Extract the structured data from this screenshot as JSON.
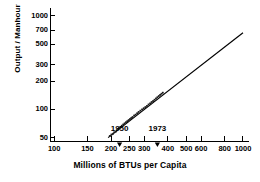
{
  "chart_data": {
    "type": "scatter",
    "title": "",
    "xlabel": "Millions of BTUs per Capita",
    "ylabel": "Output / Manhour",
    "xscale": "log",
    "yscale": "log",
    "xlim": [
      95,
      1050
    ],
    "ylim": [
      46,
      1100
    ],
    "grid": false,
    "legend": null,
    "xticks": [
      100,
      150,
      200,
      250,
      300,
      400,
      500,
      600,
      800,
      1000
    ],
    "xticklabels": [
      "100",
      "150",
      "200",
      "250",
      "300",
      "400",
      "500",
      "600",
      "800",
      "1000"
    ],
    "yticks": [
      50,
      100,
      200,
      300,
      500,
      700,
      1000
    ],
    "yticklabels": [
      "50",
      "100",
      "200",
      "300",
      "500",
      "700",
      "1000"
    ],
    "series": [
      {
        "name": "observations",
        "type": "scatter",
        "marker": "dot",
        "x": [
          197,
          201,
          205,
          208,
          212,
          215,
          218,
          221,
          224,
          228,
          232,
          236,
          240,
          244,
          248,
          252,
          256,
          260,
          265,
          270,
          275,
          280,
          286,
          292,
          298,
          304,
          310,
          316,
          322,
          328,
          334,
          340,
          346,
          352,
          358,
          364,
          370,
          376
        ],
        "y": [
          52,
          54,
          55,
          57,
          58,
          60,
          62,
          63,
          65,
          67,
          69,
          71,
          73,
          75,
          77,
          79,
          81,
          83,
          86,
          88,
          91,
          94,
          97,
          100,
          103,
          106,
          109,
          113,
          116,
          120,
          123,
          127,
          131,
          135,
          139,
          143,
          147,
          151
        ]
      },
      {
        "name": "fit-line",
        "type": "line",
        "x": [
          193,
          1000
        ],
        "y": [
          50,
          660
        ]
      }
    ],
    "annotations": [
      {
        "label": "1950",
        "x": 222,
        "marker": "down-arrow"
      },
      {
        "label": "1973",
        "x": 352,
        "marker": "down-arrow"
      }
    ]
  },
  "colors": {
    "ink": "#000000",
    "background": "#ffffff",
    "axis": "#000000",
    "marker": "#1a1a1a"
  }
}
